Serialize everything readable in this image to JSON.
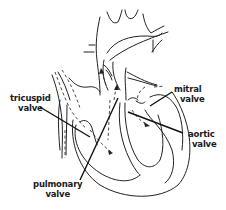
{
  "diagram": {
    "line_color": "#222222",
    "background": "#ffffff",
    "labels": {
      "tricuspid": {
        "line1": "tricuspid",
        "line2": "valve"
      },
      "mitral": {
        "line1": "mitral",
        "line2": "valve"
      },
      "aortic": {
        "line1": "aortic",
        "line2": "valve"
      },
      "pulmonary": {
        "line1": "pulmonary",
        "line2": "valve"
      }
    },
    "flow_arrows": "dashed"
  }
}
